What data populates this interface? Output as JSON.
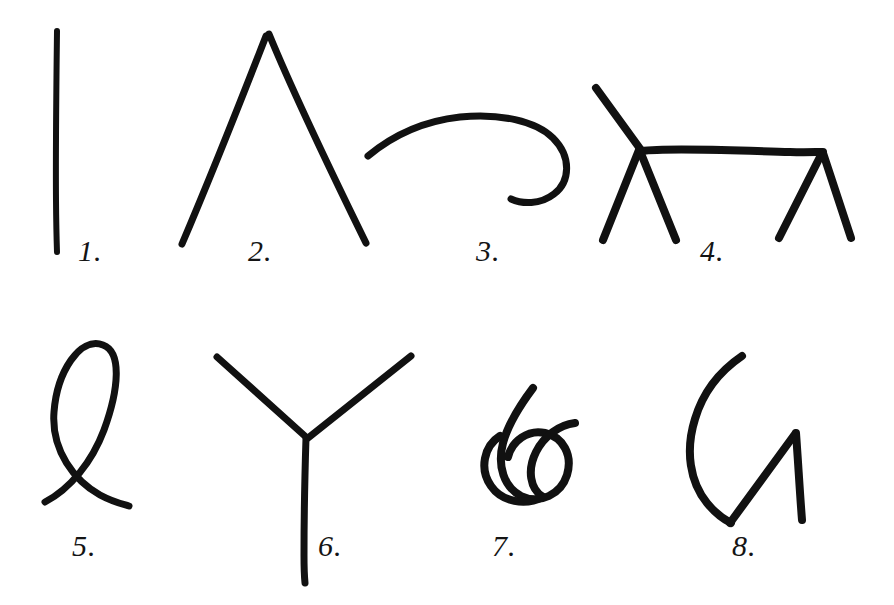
{
  "page": {
    "background_color": "#ffffff",
    "ink_color": "#111111",
    "width": 894,
    "height": 605,
    "rows": 2,
    "columns": 4,
    "item_count": 8
  },
  "figures": [
    {
      "number": "1.",
      "label": "1.",
      "name": "vertical-stroke",
      "description": "single straight vertical line",
      "label_x": 78,
      "label_y": 236,
      "row": 1,
      "column": 1,
      "stroke_width": 6
    },
    {
      "number": "2.",
      "label": "2.",
      "name": "peak-chevron",
      "description": "inverted V peak, two long straight strokes meeting at apex",
      "label_x": 248,
      "label_y": 236,
      "row": 1,
      "column": 2,
      "stroke_width": 7
    },
    {
      "number": "3.",
      "label": "3.",
      "name": "hook-spiral",
      "description": "long arc curling into an open hook at the right end",
      "label_x": 476,
      "label_y": 236,
      "row": 1,
      "column": 3,
      "stroke_width": 7
    },
    {
      "number": "4.",
      "label": "4.",
      "name": "four-legged-stick-animal",
      "description": "stick figure of a four legged animal with neck, back and four splayed legs",
      "label_x": 700,
      "label_y": 236,
      "row": 1,
      "column": 4,
      "stroke_width": 8
    },
    {
      "number": "5.",
      "label": "5.",
      "name": "crossed-loop",
      "description": "tall teardrop loop crossing itself near the bottom with two open tails",
      "label_x": 72,
      "label_y": 531,
      "row": 2,
      "column": 1,
      "stroke_width": 7
    },
    {
      "number": "6.",
      "label": "6.",
      "name": "y-junction",
      "description": "Y shaped three way junction with two upper arms and one long stem",
      "label_x": 318,
      "label_y": 531,
      "row": 2,
      "column": 2,
      "stroke_width": 7
    },
    {
      "number": "7.",
      "label": "7.",
      "name": "overhand-knot",
      "description": "two interlocking loops forming an overhand knot with a trailing end",
      "label_x": 492,
      "label_y": 531,
      "row": 2,
      "column": 3,
      "stroke_width": 8
    },
    {
      "number": "8.",
      "label": "8.",
      "name": "g-curve-with-zigzag",
      "description": "large C shaped arc joined to an angular zigzag resembling the letter G",
      "label_x": 732,
      "label_y": 531,
      "row": 2,
      "column": 4,
      "stroke_width": 8
    }
  ]
}
